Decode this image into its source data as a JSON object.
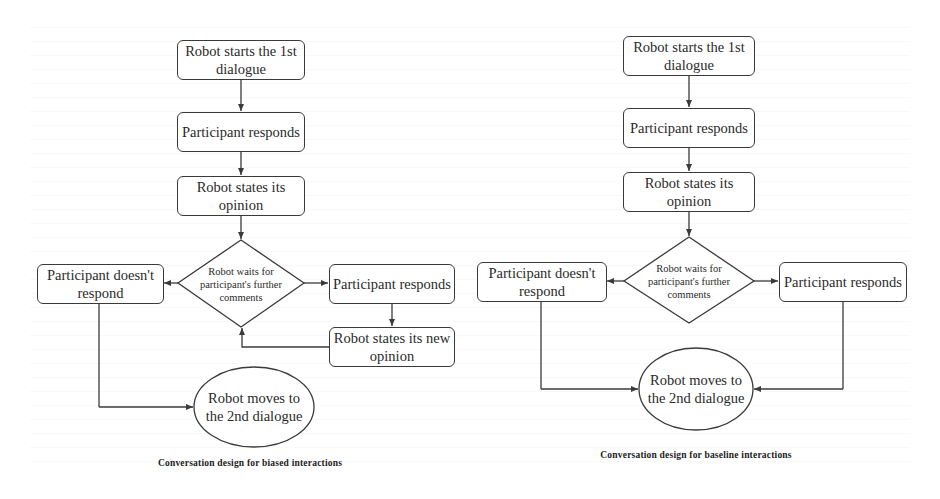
{
  "colors": {
    "stroke": "#3a3a3a",
    "text": "#2a2a2a",
    "background": "#ffffff"
  },
  "left_diagram": {
    "caption": "Conversation design for biased interactions",
    "start": "Robot starts the 1st dialogue",
    "participant_responds_1": "Participant responds",
    "robot_opinion": "Robot states its opinion",
    "decision": "Robot waits for participant's further comments",
    "no_response": "Participant doesn't respond",
    "participant_responds_2": "Participant responds",
    "robot_new_opinion": "Robot states its new opinion",
    "end": "Robot moves to the 2nd dialogue"
  },
  "right_diagram": {
    "caption": "Conversation design for baseline interactions",
    "start": "Robot starts the 1st dialogue",
    "participant_responds_1": "Participant responds",
    "robot_opinion": "Robot states its opinion",
    "decision": "Robot waits for participant's further comments",
    "no_response": "Participant doesn't respond",
    "participant_responds_2": "Participant responds",
    "end": "Robot moves to the 2nd dialogue"
  }
}
